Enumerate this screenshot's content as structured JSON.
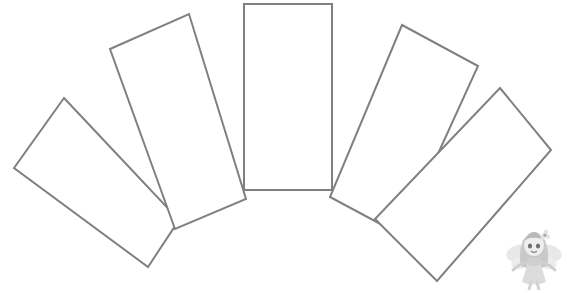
{
  "page": {
    "background_color": "#ffffff",
    "width": 567,
    "height": 293
  },
  "drawing": {
    "name": "fan-template-outline",
    "description": "Five identical elongated rectangles fanned out in a semicircular arrangement, drawn as gray outlines on a white background",
    "stroke_color": "#808080",
    "fill_color": "#ffffff",
    "stroke_width": 2,
    "blade_count": 5,
    "blades": [
      {
        "name": "fan-blade-1",
        "label": "blade-far-left",
        "rotation_deg": -55,
        "points": "64,98 178,18 0,0 0,0"
      },
      {
        "name": "fan-blade-2",
        "label": "blade-left",
        "rotation_deg": -28,
        "points": ""
      },
      {
        "name": "fan-blade-3",
        "label": "blade-center",
        "rotation_deg": 0,
        "points": "243,4 332,4 332,190 243,190"
      },
      {
        "name": "fan-blade-4",
        "label": "blade-right",
        "rotation_deg": 28,
        "points": ""
      },
      {
        "name": "fan-blade-5",
        "label": "blade-far-right",
        "rotation_deg": 55,
        "points": ""
      }
    ]
  },
  "mascot": {
    "name": "fairy-mascot",
    "description": "Small grayscale cartoon fairy girl with wings and a flower in her hair",
    "color": "#c8c8c8",
    "accent_color": "#9a9a9a"
  }
}
